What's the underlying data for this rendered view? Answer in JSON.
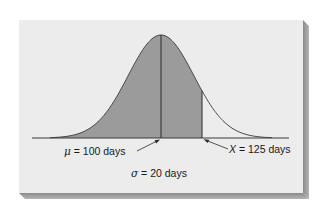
{
  "figure": {
    "panel_color": "#ececec",
    "shadow_color": "#9c9c9c",
    "fill_color": "#9b9b9b",
    "line_color": "#3a3a3a"
  },
  "chart_data": {
    "type": "area",
    "title": "",
    "distribution": "normal",
    "mean": 100,
    "std_dev": 20,
    "x_value": 125,
    "unit": "days",
    "shaded_region": {
      "from": "-inf",
      "to": 125
    },
    "annotations": [
      {
        "symbol": "μ",
        "text": " = 100 days",
        "points_to": 100
      },
      {
        "symbol": "X",
        "text": " = 125 days",
        "points_to": 125
      },
      {
        "symbol": "σ",
        "text": " = 20 days"
      }
    ],
    "xlabel": "",
    "ylabel": "",
    "grid": false
  },
  "labels": {
    "mu_symbol": "μ",
    "mu_text": " = 100 days",
    "x_symbol": "X",
    "x_text": " = 125 days",
    "sigma_symbol": "σ",
    "sigma_text": " = 20 days"
  }
}
